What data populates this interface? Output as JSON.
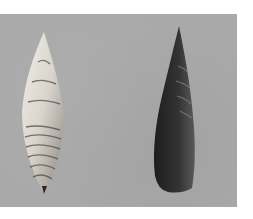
{
  "image": {
    "description": "Photograph of two stone projectile points on a gray background",
    "background_color": "#a9a9a9",
    "margin_color": "#ffffff",
    "objects": [
      {
        "name": "light-flint-point",
        "shape": "leaf-shaped, pointed both ends",
        "color": "#d8d4cc"
      },
      {
        "name": "dark-obsidian-point",
        "shape": "lanceolate, pointed tip, rounded base",
        "color": "#2a2a2a"
      }
    ]
  }
}
